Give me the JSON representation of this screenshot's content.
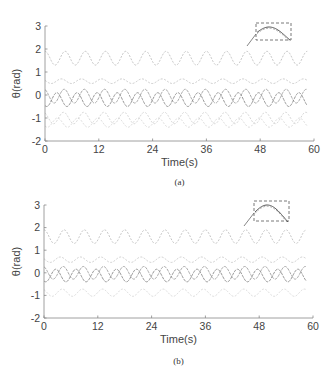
{
  "figure": {
    "captions": [
      "(a)",
      "(b)"
    ]
  },
  "chart_data": [
    {
      "panel": "(a)",
      "type": "line",
      "title": "",
      "xlabel": "Time(s)",
      "ylabel": "θ(rad)",
      "xlim": [
        0,
        60
      ],
      "ylim": [
        -2,
        3
      ],
      "xticks": [
        0,
        12,
        24,
        36,
        48,
        60
      ],
      "yticks": [
        -2,
        -1,
        0,
        1,
        2,
        3
      ],
      "grid": false,
      "legend": null,
      "period_s": 4.5,
      "series": [
        {
          "name": "curve-1",
          "center": 1.6,
          "amplitude": 0.3,
          "phase": 0.0,
          "color": "#bdbdbd",
          "dash": "2,1.5"
        },
        {
          "name": "curve-2",
          "center": 0.6,
          "amplitude": 0.1,
          "phase": 1.2,
          "color": "#c4c4c4",
          "dash": "2,1.5"
        },
        {
          "name": "curve-3",
          "center": -0.05,
          "amplitude": 0.3,
          "phase": 0.3,
          "color": "#9e9e9e",
          "dash": "3,1"
        },
        {
          "name": "curve-4",
          "center": -0.2,
          "amplitude": 0.3,
          "phase": 2.6,
          "color": "#8a8a8a",
          "dash": "3,1"
        },
        {
          "name": "curve-5",
          "center": -1.0,
          "amplitude": 0.25,
          "phase": 0.5,
          "color": "#cfcfcf",
          "dash": "2,1.5"
        },
        {
          "name": "curve-6",
          "center": -1.2,
          "amplitude": 0.2,
          "phase": 2.4,
          "color": "#d6d6d6",
          "dash": "2,1.5"
        }
      ],
      "annotation": "dashed zoom box around a peak near t≈47–55 s, with connector line"
    },
    {
      "panel": "(b)",
      "type": "line",
      "title": "",
      "xlabel": "Time(s)",
      "ylabel": "θ(rad)",
      "xlim": [
        0,
        60
      ],
      "ylim": [
        -2,
        3
      ],
      "xticks": [
        0,
        12,
        24,
        36,
        48,
        60
      ],
      "yticks": [
        -2,
        -1,
        0,
        1,
        2,
        3
      ],
      "grid": false,
      "legend": null,
      "period_s": 4.5,
      "series": [
        {
          "name": "curve-1",
          "center": 1.6,
          "amplitude": 0.3,
          "phase": 0.0,
          "color": "#bdbdbd",
          "dash": "2,1.5"
        },
        {
          "name": "curve-2",
          "center": 0.58,
          "amplitude": 0.12,
          "phase": 1.2,
          "color": "#c8c8c8",
          "dash": "2,1.5"
        },
        {
          "name": "curve-3",
          "center": 0.0,
          "amplitude": 0.28,
          "phase": 0.3,
          "color": "#9e9e9e",
          "dash": "3,1"
        },
        {
          "name": "curve-4",
          "center": -0.12,
          "amplitude": 0.28,
          "phase": 2.6,
          "color": "#8a8a8a",
          "dash": "3,1"
        },
        {
          "name": "curve-5",
          "center": -0.88,
          "amplitude": 0.16,
          "phase": 0.6,
          "color": "#d6d6d6",
          "dash": "2,1.5"
        }
      ],
      "annotation": "dashed zoom box around a peak near t≈47–55 s, with connector line"
    }
  ],
  "layout": {
    "panels": [
      {
        "x0": 45,
        "x1": 314,
        "yTop": 26,
        "yBottom": 141,
        "inset": {
          "x": 256,
          "y": 23,
          "w": 35,
          "h": 17,
          "lineFrom": [
            247,
            46
          ],
          "lineTo": [
            256,
            34
          ]
        },
        "xlabelY": 166,
        "captionY": 185,
        "ylabelX": 20
      },
      {
        "x0": 44,
        "x1": 313,
        "yTop": 205,
        "yBottom": 318,
        "inset": {
          "x": 254,
          "y": 201,
          "w": 35,
          "h": 20,
          "lineFrom": [
            244,
            226
          ],
          "lineTo": [
            254,
            213
          ]
        },
        "xlabelY": 343,
        "captionY": 364,
        "ylabelX": 20
      }
    ]
  }
}
